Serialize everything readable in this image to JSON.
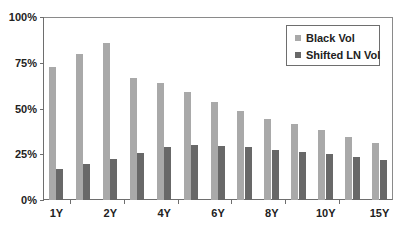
{
  "chart_data": {
    "type": "bar",
    "title": "",
    "xlabel": "",
    "ylabel": "",
    "ylim": [
      0,
      100
    ],
    "yticks": [
      "0%",
      "25%",
      "50%",
      "75%",
      "100%"
    ],
    "categories": [
      "1Y",
      "",
      "2Y",
      "",
      "4Y",
      "",
      "6Y",
      "",
      "8Y",
      "",
      "10Y",
      "",
      "15Y"
    ],
    "series": [
      {
        "name": "Black Vol",
        "color": "#a9a9a9",
        "values": [
          72.8,
          79.8,
          85.7,
          66.5,
          64.0,
          59.0,
          53.5,
          48.5,
          44.5,
          41.4,
          38.2,
          34.4,
          31.1
        ]
      },
      {
        "name": "Shifted LN Vol",
        "color": "#686868",
        "values": [
          17.1,
          19.5,
          22.4,
          25.9,
          29.0,
          30.0,
          29.6,
          28.7,
          27.6,
          26.5,
          25.4,
          23.5,
          22.1
        ]
      }
    ],
    "grid": false,
    "legend_position": "upper right"
  },
  "legend": {
    "items": [
      {
        "label": "Black Vol",
        "color": "#a9a9a9"
      },
      {
        "label": "Shifted LN Vol",
        "color": "#686868"
      }
    ]
  }
}
